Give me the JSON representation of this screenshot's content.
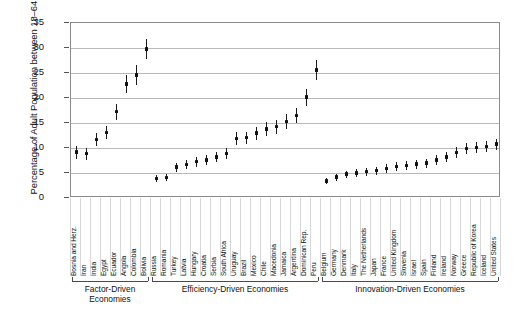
{
  "chart_data": {
    "type": "scatter",
    "title": "",
    "xlabel": "",
    "ylabel": "Percentage of Adult Population between 18–64 Years",
    "ylim": [
      0,
      35
    ],
    "yticks": [
      0,
      5,
      10,
      15,
      20,
      25,
      30,
      35
    ],
    "grid": true,
    "legend": "none",
    "error_bars": true,
    "marker_color": "#111111",
    "categories": [
      "Bosnia and Herz.",
      "Iran",
      "India",
      "Egypt",
      "Ecuador",
      "Angola",
      "Colombia",
      "Bolivia",
      "Russia",
      "Romania",
      "Turkey",
      "Latvia",
      "Hungary",
      "Croatia",
      "Serbia",
      "South Africa",
      "Uruguay",
      "Brazil",
      "Mexico",
      "Chile",
      "Macedonia",
      "Jamaica",
      "Argentina",
      "Dominican Rep.",
      "Peru",
      "Belgium",
      "Germany",
      "Denmark",
      "Italy",
      "The Netherlands",
      "Japan",
      "France",
      "United Kingdom",
      "Slovenia",
      "Israel",
      "Spain",
      "Finland",
      "Ireland",
      "Norway",
      "Greece",
      "Republic of Korea",
      "Iceland",
      "United States"
    ],
    "values": [
      9.2,
      8.9,
      11.7,
      13.1,
      17.3,
      22.8,
      24.6,
      29.8,
      3.9,
      4.1,
      6.2,
      6.7,
      7.3,
      7.6,
      8.2,
      8.9,
      11.9,
      12.1,
      13.0,
      13.8,
      14.3,
      15.3,
      16.5,
      20.2,
      25.6,
      3.4,
      4.2,
      4.8,
      5.0,
      5.3,
      5.5,
      5.9,
      6.3,
      6.5,
      6.8,
      7.0,
      7.6,
      8.2,
      9.1,
      9.9,
      10.1,
      10.3,
      10.8
    ],
    "err_low": [
      7.9,
      7.7,
      10.4,
      11.8,
      15.7,
      21.0,
      22.6,
      27.8,
      3.2,
      3.4,
      5.3,
      5.8,
      6.3,
      6.6,
      7.2,
      7.8,
      10.6,
      10.9,
      11.7,
      12.4,
      12.9,
      13.8,
      15.0,
      18.5,
      23.6,
      2.8,
      3.5,
      4.1,
      4.2,
      4.5,
      4.7,
      5.0,
      5.4,
      5.6,
      5.9,
      6.1,
      6.6,
      7.2,
      8.0,
      8.8,
      9.0,
      9.2,
      9.7
    ],
    "err_high": [
      10.5,
      10.1,
      13.0,
      14.4,
      18.9,
      24.6,
      26.6,
      31.8,
      4.6,
      4.8,
      7.1,
      7.6,
      8.3,
      8.6,
      9.2,
      10.0,
      13.2,
      13.3,
      14.3,
      15.2,
      15.7,
      16.8,
      18.0,
      21.9,
      27.6,
      4.0,
      4.9,
      5.5,
      5.8,
      6.1,
      6.3,
      6.8,
      7.2,
      7.4,
      7.7,
      7.9,
      8.6,
      9.2,
      10.2,
      11.0,
      11.2,
      11.4,
      11.9
    ],
    "groups": [
      {
        "label": "Factor-Driven Economies",
        "start": 0,
        "end": 7
      },
      {
        "label": "Efficiency-Driven Economies",
        "start": 8,
        "end": 24
      },
      {
        "label": "Innovation-Driven Economies",
        "start": 25,
        "end": 42
      }
    ]
  }
}
